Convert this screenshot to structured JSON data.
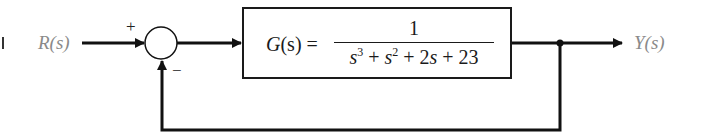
{
  "diagram": {
    "type": "closed-loop feedback control block diagram",
    "input": {
      "label": "R(s)"
    },
    "output": {
      "label": "Y(s)"
    },
    "summing_junction": {
      "plus_sign": "+",
      "minus_sign": "−"
    },
    "plant": {
      "lhs": "G(s) =",
      "lhs_func": "G",
      "lhs_arg": "(s)",
      "equals": "=",
      "numerator": "1",
      "denominator": {
        "t1_var": "s",
        "t1_exp": "3",
        "op1": " + ",
        "t2_var": "s",
        "t2_exp": "2",
        "op2": " + 2",
        "t3_var": "s",
        "op3": " + 23"
      },
      "denominator_text": "s^3 + s^2 + 2s + 23"
    },
    "feedback": "unity negative feedback",
    "colors": {
      "stroke": "#1a1a1a",
      "io_label": "#8a8a8a",
      "background": "#ffffff"
    }
  }
}
